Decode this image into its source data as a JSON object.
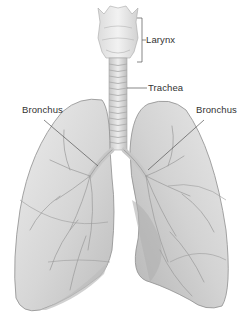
{
  "diagram": {
    "labels": [
      {
        "id": "larynx",
        "text": "Larynx"
      },
      {
        "id": "trachea",
        "text": "Trachea"
      },
      {
        "id": "bronchus_left",
        "text": "Bronchus"
      },
      {
        "id": "bronchus_right",
        "text": "Bronchus"
      }
    ],
    "colors": {
      "background": "#ffffff",
      "lung_fill": "#d9d9d9",
      "lung_shade": "#b9b9b9",
      "lung_highlight": "#ececec",
      "outline": "#8a8a8a",
      "vessels": "#9a9a9a",
      "leader_line": "#555555",
      "label_text": "#333333"
    }
  }
}
